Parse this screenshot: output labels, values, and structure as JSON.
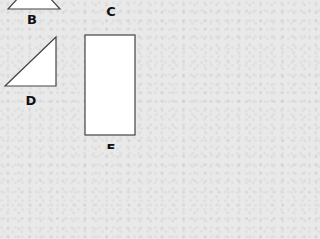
{
  "diagram": {
    "background_color": "#e9e9e9",
    "stroke_color": "#444444",
    "fill_color": "#ffffff",
    "shapes": [
      {
        "id": "B",
        "type": "triangle",
        "label": "B",
        "points": "8,9 60,9 48,-4 20,-4",
        "label_pos": {
          "x": 32,
          "y": 13
        }
      },
      {
        "id": "C",
        "type": "unknown",
        "label": "C",
        "label_pos": {
          "x": 111,
          "y": 5
        }
      },
      {
        "id": "D",
        "type": "right-triangle",
        "label": "D",
        "points": "5,86 56,86 56,37",
        "label_pos": {
          "x": 31,
          "y": 94
        }
      },
      {
        "id": "E",
        "type": "rectangle",
        "label": "E",
        "rect": {
          "x": 85,
          "y": 35,
          "width": 50,
          "height": 100
        },
        "label_pos": {
          "x": 111,
          "y": 142
        }
      }
    ]
  }
}
